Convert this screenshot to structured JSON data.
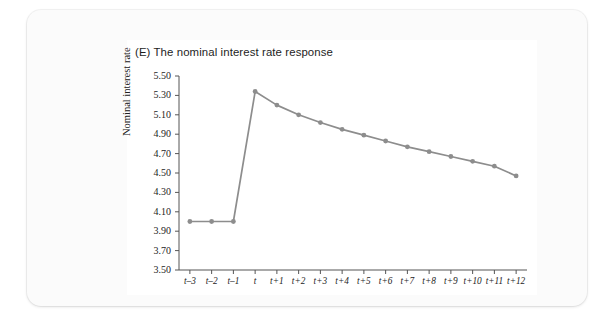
{
  "figure": {
    "title": "(E) The nominal interest rate response",
    "line_color": "#8d8d8d",
    "marker_color": "#8d8d8d",
    "axis_color": "#555555",
    "panel_background": "#ffffff",
    "card_background": "#fbfbfb"
  },
  "chart_data": {
    "type": "line",
    "title": "(E) The nominal interest rate response",
    "xlabel": "",
    "ylabel": "Nominal interest rate",
    "categories": [
      "t–3",
      "t–2",
      "t–1",
      "t",
      "t+1",
      "t+2",
      "t+3",
      "t+4",
      "t+5",
      "t+6",
      "t+7",
      "t+8",
      "t+9",
      "t+10",
      "t+11",
      "t+12"
    ],
    "values": [
      4.0,
      4.0,
      4.0,
      5.34,
      5.2,
      5.1,
      5.02,
      4.95,
      4.89,
      4.83,
      4.77,
      4.72,
      4.67,
      4.62,
      4.57,
      4.47
    ],
    "ylim": [
      3.5,
      5.5
    ],
    "ytick_labels": [
      "5.50",
      "5.30",
      "5.10",
      "4.90",
      "4.70",
      "4.50",
      "4.30",
      "4.10",
      "3.90",
      "3.70",
      "3.50"
    ],
    "ytick_values": [
      5.5,
      5.3,
      5.1,
      4.9,
      4.7,
      4.5,
      4.3,
      4.1,
      3.9,
      3.7,
      3.5
    ],
    "grid": false,
    "legend": null,
    "markers": true,
    "series": [
      {
        "name": "Nominal interest rate",
        "values": [
          4.0,
          4.0,
          4.0,
          5.34,
          5.2,
          5.1,
          5.02,
          4.95,
          4.89,
          4.83,
          4.77,
          4.72,
          4.67,
          4.62,
          4.57,
          4.47
        ]
      }
    ]
  }
}
